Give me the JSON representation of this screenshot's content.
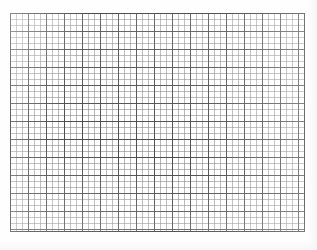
{
  "document": {
    "type": "graph-paper-grid",
    "background_color": "#fefefe",
    "header_text": "",
    "header_visible": false
  },
  "grid": {
    "label": "graph paper grid",
    "left_px": 10,
    "top_px": 13,
    "width_px": 295,
    "height_px": 219,
    "minor_cell_px": 6,
    "major_every_n_cells": 3,
    "major_cell_px": 18,
    "minor_columns": 49,
    "minor_rows": 36,
    "major_columns": 16,
    "major_rows": 12,
    "minor_line_color": "#787878",
    "major_line_color": "#3c3c3c",
    "border_color": "#2b2b2b",
    "border_width_px": 1.6,
    "cell_fill_color": "#ffffff"
  }
}
